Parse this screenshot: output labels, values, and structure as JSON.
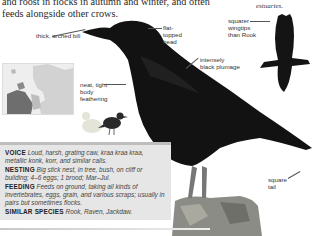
{
  "intro_text": "and roost in flocks in autumn and winter, and often feeds alongside other crows.",
  "intro_partial_top": "…may gather to feed",
  "side_note": "estuaries.",
  "labels": {
    "bill": "thick, arched bill",
    "head": "flat-topped head",
    "wingtips": "squarer wingtips than Rook",
    "plumage": "intensely black plumage",
    "body": "neat, tight body feathering",
    "tail": "square tail"
  },
  "infobox": {
    "voice_label": "VOICE",
    "voice_text": "Loud, harsh, grating caw, kraa kraa kraa, metallic konk, korr, and similar calls.",
    "nesting_label": "NESTING",
    "nesting_text": "Big stick nest, in tree, bush, on cliff or building; 4–6 eggs; 1 brood; Mar–Jul.",
    "feeding_label": "FEEDING",
    "feeding_text": "Feeds on ground, taking all kinds of invertebrates, eggs, grain, and various scraps; usually in pairs but sometimes flocks.",
    "similar_label": "SIMILAR SPECIES",
    "similar_text": "Rook, Raven, Jackdaw."
  },
  "figures": {
    "main_bird": "Carrion Crow perched on post",
    "flight_silhouette": "Crow in flight",
    "map": "Europe distribution map",
    "size_comparison": "size comparison with duck"
  },
  "colors": {
    "bird": "#111111",
    "infobox_bg": "#e6e6e6",
    "map_range": "#7a7a7a"
  }
}
